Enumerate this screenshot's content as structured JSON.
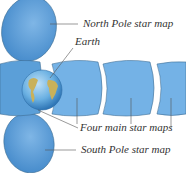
{
  "diagram": {
    "labels": {
      "north": "North Pole star map",
      "earth": "Earth",
      "main": "Four main star maps",
      "south": "South Pole star map"
    },
    "colors": {
      "map_fill": "#5b9fd8",
      "map_fill_light": "#7fb6e6",
      "map_stroke": "#3f6f95",
      "leader": "#555555",
      "ocean": "#5ca7de",
      "land": "#c9b15a"
    },
    "main_map_count": 4
  }
}
